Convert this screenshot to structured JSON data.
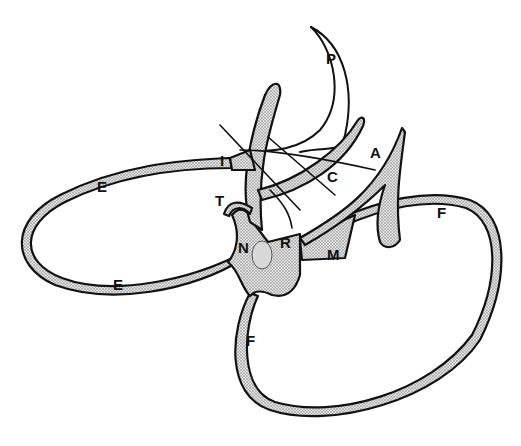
{
  "figure": {
    "type": "labeled line drawing",
    "shading": "stippled",
    "labels": [
      {
        "id": "P",
        "text": "P",
        "x": 326,
        "y": 64
      },
      {
        "id": "I",
        "text": "I",
        "x": 220,
        "y": 166
      },
      {
        "id": "A",
        "text": "A",
        "x": 370,
        "y": 158
      },
      {
        "id": "C",
        "text": "C",
        "x": 327,
        "y": 182
      },
      {
        "id": "E_upper",
        "text": "E",
        "x": 97,
        "y": 192
      },
      {
        "id": "T",
        "text": "T",
        "x": 215,
        "y": 206
      },
      {
        "id": "F_right",
        "text": "F",
        "x": 437,
        "y": 218
      },
      {
        "id": "N",
        "text": "N",
        "x": 238,
        "y": 253
      },
      {
        "id": "R",
        "text": "R",
        "x": 280,
        "y": 248
      },
      {
        "id": "M",
        "text": "M",
        "x": 327,
        "y": 260
      },
      {
        "id": "E_lower",
        "text": "E",
        "x": 113,
        "y": 290
      },
      {
        "id": "F_lower",
        "text": "F",
        "x": 246,
        "y": 346
      }
    ],
    "colors": {
      "ink": "#111111",
      "background": "#ffffff",
      "stipple": "#9a9a9a"
    }
  }
}
